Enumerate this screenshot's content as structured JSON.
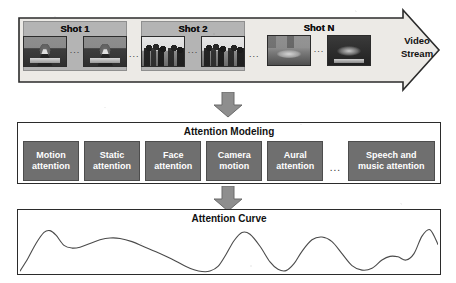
{
  "figure": {
    "colors": {
      "shot_group_fill": "#b4b4b4",
      "model_box_fill": "#6f6f6f",
      "arrow_fill": "#8e8e8e",
      "outline": "#2b2b2b",
      "curve_stroke": "#4a4a4a"
    }
  },
  "stream": {
    "label_line1": "Video",
    "label_line2": "Stream",
    "inter_shot_dots": "...",
    "shots": [
      {
        "label": "Shot 1",
        "frame_dots": "...",
        "frames": [
          "anchor-frame-thumbnail",
          "anchor-frame-thumbnail"
        ]
      },
      {
        "label": "Shot 2",
        "frame_dots": "...",
        "frames": [
          "crowd-frame-thumbnail",
          "crowd-frame-thumbnail"
        ]
      },
      {
        "label": "Shot N",
        "frame_dots": "...",
        "frames": [
          "scene-frame-thumbnail",
          "night-frame-thumbnail"
        ]
      }
    ]
  },
  "arrows": {
    "arrow1": "down-arrow-icon",
    "arrow2": "down-arrow-icon"
  },
  "modeling": {
    "title": "Attention Modeling",
    "dots": "...",
    "boxes": [
      {
        "line1": "Motion",
        "line2": "attention",
        "width": "std"
      },
      {
        "line1": "Static",
        "line2": "attention",
        "width": "std"
      },
      {
        "line1": "Face",
        "line2": "attention",
        "width": "std"
      },
      {
        "line1": "Camera",
        "line2": "motion",
        "width": "std"
      },
      {
        "line1": "Aural",
        "line2": "attention",
        "width": "std"
      },
      {
        "line1": "Speech and",
        "line2": "music attention",
        "width": "wide"
      }
    ]
  },
  "curve": {
    "title": "Attention Curve",
    "chart_data": {
      "type": "line",
      "title": "Attention Curve",
      "xlabel": "",
      "ylabel": "",
      "xlim": [
        0,
        418
      ],
      "ylim": [
        0,
        1
      ],
      "grid": false,
      "legend": "none",
      "x": [
        0,
        8,
        16,
        24,
        30,
        36,
        44,
        52,
        60,
        70,
        80,
        90,
        100,
        112,
        124,
        136,
        148,
        158,
        166,
        174,
        182,
        190,
        198,
        206,
        214,
        222,
        230,
        240,
        250,
        258,
        266,
        274,
        282,
        292,
        302,
        312,
        322,
        332,
        342,
        352,
        362,
        370,
        378,
        386,
        394,
        402,
        410,
        418
      ],
      "y": [
        0.02,
        0.3,
        0.62,
        0.86,
        0.9,
        0.8,
        0.58,
        0.52,
        0.54,
        0.62,
        0.7,
        0.74,
        0.73,
        0.66,
        0.55,
        0.44,
        0.32,
        0.21,
        0.12,
        0.05,
        0.01,
        0.02,
        0.12,
        0.38,
        0.68,
        0.86,
        0.82,
        0.56,
        0.22,
        0.06,
        0.03,
        0.18,
        0.45,
        0.7,
        0.76,
        0.66,
        0.4,
        0.14,
        0.04,
        0.08,
        0.26,
        0.34,
        0.33,
        0.26,
        0.4,
        0.78,
        0.92,
        0.6
      ]
    }
  }
}
